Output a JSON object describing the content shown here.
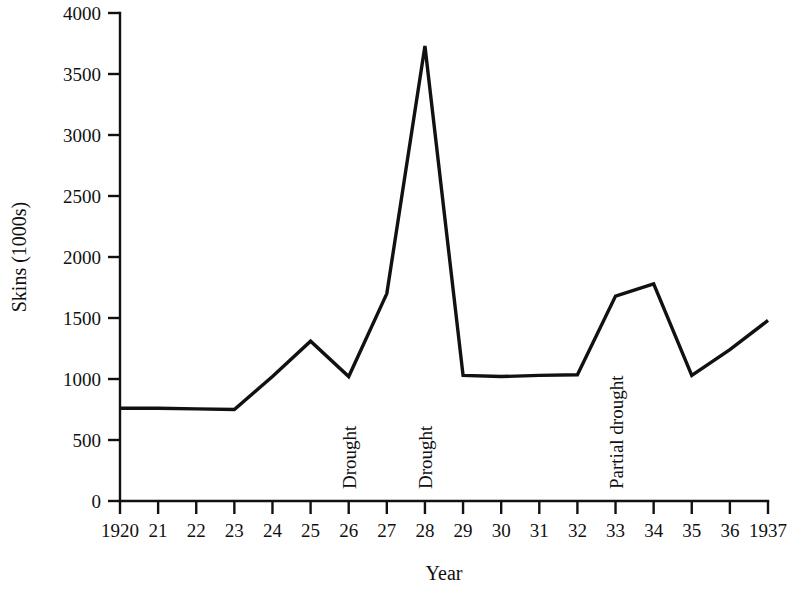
{
  "chart_data": {
    "type": "line",
    "title": "",
    "xlabel": "Year",
    "ylabel": "Skins (1000s)",
    "xlim": [
      1920,
      1937
    ],
    "ylim": [
      0,
      4000
    ],
    "ytick_values": [
      0,
      500,
      1000,
      1500,
      2000,
      2500,
      3000,
      3500,
      4000
    ],
    "ytick_labels": [
      "0",
      "500",
      "1000",
      "1500",
      "2000",
      "2500",
      "3000",
      "3500",
      "4000"
    ],
    "xtick_values": [
      1920,
      1921,
      1922,
      1923,
      1924,
      1925,
      1926,
      1927,
      1928,
      1929,
      1930,
      1931,
      1932,
      1933,
      1934,
      1935,
      1936,
      1937
    ],
    "xtick_labels": [
      "1920",
      "21",
      "22",
      "23",
      "24",
      "25",
      "26",
      "27",
      "28",
      "29",
      "30",
      "31",
      "32",
      "33",
      "34",
      "35",
      "36",
      "1937"
    ],
    "grid": false,
    "legend": "none",
    "line_color": "#111111",
    "series": [
      {
        "name": "Skins",
        "x": [
          1920,
          1921,
          1922,
          1923,
          1924,
          1925,
          1926,
          1927,
          1928,
          1929,
          1930,
          1931,
          1932,
          1933,
          1934,
          1935,
          1936,
          1937
        ],
        "values": [
          760,
          760,
          755,
          750,
          1020,
          1310,
          1020,
          1700,
          3730,
          1030,
          1020,
          1030,
          1035,
          1680,
          1780,
          1030,
          1240,
          1480
        ]
      }
    ],
    "annotations": [
      {
        "text": "Drought",
        "x": 1926,
        "orientation": "vertical"
      },
      {
        "text": "Drought",
        "x": 1928,
        "orientation": "vertical"
      },
      {
        "text": "Partial drought",
        "x": 1933,
        "orientation": "vertical"
      }
    ]
  }
}
